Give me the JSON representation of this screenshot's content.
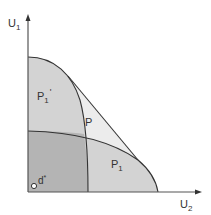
{
  "diagram": {
    "axes": {
      "y_label": "U",
      "y_label_sub": "1",
      "x_label": "U",
      "x_label_sub": "2"
    },
    "regions": {
      "p1_prime": {
        "label": "P",
        "sub": "1",
        "prime": "'"
      },
      "p": {
        "label": "P"
      },
      "p1": {
        "label": "P",
        "sub": "1"
      }
    },
    "point": {
      "label": "d",
      "sup": "*"
    },
    "colors": {
      "axis": "#555555",
      "curve": "#333333",
      "overlap_fill": "#b4b4b4",
      "region_fill": "#d3d3d3",
      "p_fill": "#ececec",
      "background": "#ffffff"
    }
  }
}
